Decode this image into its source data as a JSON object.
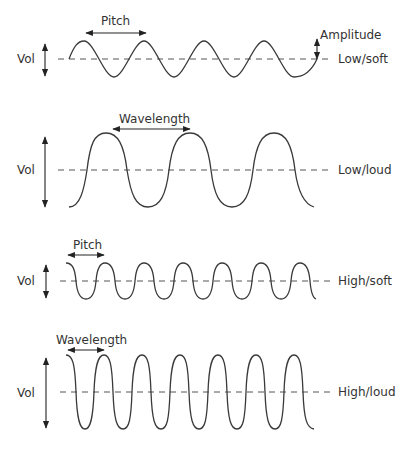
{
  "diagram": {
    "type": "sound-wave-comparison",
    "colors": {
      "wave": "#3a3a3a",
      "text": "#333333",
      "midline": "#555555",
      "background": "#ffffff"
    },
    "panels": [
      {
        "id": "low-soft",
        "y_label": "Vol",
        "right_label": "Low/soft",
        "annotations": [
          "Pitch",
          "Amplitude"
        ],
        "frequency": "low",
        "volume": "soft"
      },
      {
        "id": "low-loud",
        "y_label": "Vol",
        "right_label": "Low/loud",
        "annotations": [
          "Wavelength"
        ],
        "frequency": "low",
        "volume": "loud"
      },
      {
        "id": "high-soft",
        "y_label": "Vol",
        "right_label": "High/soft",
        "annotations": [
          "Pitch"
        ],
        "frequency": "high",
        "volume": "soft"
      },
      {
        "id": "high-loud",
        "y_label": "Vol",
        "right_label": "High/loud",
        "annotations": [
          "Wavelength"
        ],
        "frequency": "high",
        "volume": "loud"
      }
    ]
  }
}
